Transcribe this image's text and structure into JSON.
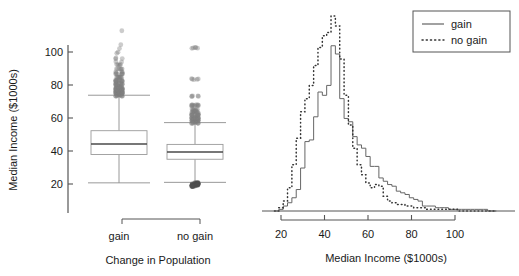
{
  "figure": {
    "panels": [
      {
        "id": "boxplot",
        "ylabel": "Median Income ($1000s)",
        "xlabel": "Change in Population",
        "group_labels": [
          "gain",
          "no gain"
        ]
      },
      {
        "id": "histogram",
        "xlabel": "Median Income ($1000s)",
        "legend": {
          "entries": [
            "gain",
            "no gain"
          ]
        }
      }
    ]
  },
  "chart_data": [
    {
      "type": "box",
      "title": "",
      "xlabel": "Change in Population",
      "ylabel": "Median Income ($1000s)",
      "ylim": [
        18,
        116
      ],
      "yticks": [
        20,
        40,
        60,
        80,
        100
      ],
      "grid": false,
      "categories": [
        "gain",
        "no gain"
      ],
      "boxes": [
        {
          "name": "gain",
          "whisker_low": 20.7,
          "q1": 37.9,
          "median": 44.2,
          "q3": 52.3,
          "whisker_high": 73.8,
          "outliers_high": [
            73.9,
            74.4,
            74.8,
            75.3,
            75.8,
            76.4,
            77.0,
            77.6,
            78.2,
            78.9,
            79.6,
            80.3,
            81.0,
            81.8,
            82.6,
            83.4,
            84.3,
            85.2,
            86.1,
            87.1,
            88.1,
            89.2,
            90.3,
            91.5,
            92.8,
            94.1,
            95.5,
            97.0,
            98.6,
            100.3,
            102.1,
            104.0,
            113.5
          ],
          "outliers_low": []
        },
        {
          "name": "no gain",
          "whisker_low": 21.0,
          "q1": 35.0,
          "median": 39.4,
          "q3": 44.0,
          "whisker_high": 57.2,
          "outliers_high": [
            57.4,
            58.0,
            58.6,
            59.2,
            59.9,
            60.6,
            61.4,
            62.3,
            63.2,
            64.2,
            65.4,
            66.8,
            68.5,
            72.8,
            83.6,
            102.8
          ],
          "outliers_low": [
            20.8,
            20.4,
            20.0,
            19.6,
            19.2
          ]
        }
      ]
    },
    {
      "type": "line",
      "title": "",
      "xlabel": "Median Income ($1000s)",
      "ylabel": "",
      "xlim": [
        17,
        120
      ],
      "xticks": [
        20,
        40,
        60,
        80,
        100
      ],
      "grid": false,
      "legend_position": "top-right",
      "x": [
        18,
        20,
        22,
        24,
        26,
        28,
        30,
        32,
        34,
        36,
        38,
        40,
        42,
        44,
        46,
        48,
        50,
        52,
        54,
        56,
        58,
        60,
        62,
        64,
        66,
        68,
        70,
        72,
        74,
        76,
        78,
        80,
        82,
        84,
        86,
        88,
        90,
        92,
        94,
        96,
        98,
        100,
        102,
        104,
        106,
        108,
        110,
        112,
        114,
        116,
        118
      ],
      "series": [
        {
          "name": "gain",
          "style": "solid",
          "values": [
            0,
            1,
            3,
            5,
            8,
            13,
            26,
            42,
            43,
            57,
            72,
            70,
            76,
            100,
            95,
            68,
            56,
            54,
            45,
            40,
            38,
            33,
            27,
            27,
            20,
            18,
            16,
            15,
            12,
            11,
            10,
            8,
            7,
            6,
            3,
            3,
            3,
            2,
            2,
            2,
            1,
            1,
            1,
            1,
            1,
            1,
            1,
            1,
            1,
            0,
            0
          ]
        },
        {
          "name": "no gain",
          "style": "dotted",
          "values": [
            0,
            2,
            6,
            14,
            28,
            44,
            60,
            68,
            76,
            88,
            99,
            106,
            108,
            118,
            112,
            92,
            70,
            52,
            38,
            28,
            22,
            17,
            14,
            16,
            15,
            9,
            6,
            5,
            4,
            4,
            3,
            3,
            2,
            2,
            2,
            1,
            1,
            1,
            1,
            1,
            1,
            1,
            0,
            0,
            0,
            0,
            0,
            0,
            0,
            0,
            0
          ]
        }
      ]
    }
  ]
}
